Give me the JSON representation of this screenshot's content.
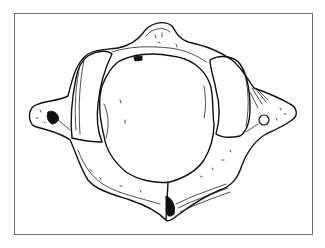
{
  "figure": {
    "frame_color": "#6f6f6f",
    "ink_color": "#111111",
    "background": "#ffffff"
  }
}
